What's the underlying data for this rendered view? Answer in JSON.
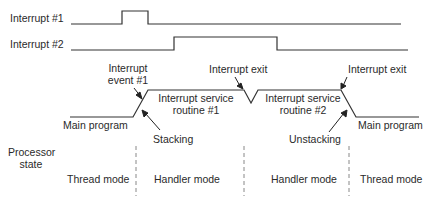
{
  "signals": {
    "interrupt1": {
      "label": "Interrupt #1"
    },
    "interrupt2": {
      "label": "Interrupt #2"
    }
  },
  "annotations": {
    "interrupt_event": {
      "line1": "Interrupt",
      "line2": "event #1"
    },
    "interrupt_exit_1": "Interrupt exit",
    "interrupt_exit_2": "Interrupt exit",
    "isr1": {
      "line1": "Interrupt service",
      "line2": "routine #1"
    },
    "isr2": {
      "line1": "Interrupt service",
      "line2": "routine #2"
    },
    "main_program_left": "Main program",
    "main_program_right": "Main program",
    "stacking": "Stacking",
    "unstacking": "Unstacking"
  },
  "processor_state": {
    "label_line1": "Processor",
    "label_line2": "state",
    "modes": [
      "Thread mode",
      "Handler mode",
      "Handler mode",
      "Thread mode"
    ]
  },
  "colors": {
    "line": "#333333",
    "dash": "#888888"
  }
}
